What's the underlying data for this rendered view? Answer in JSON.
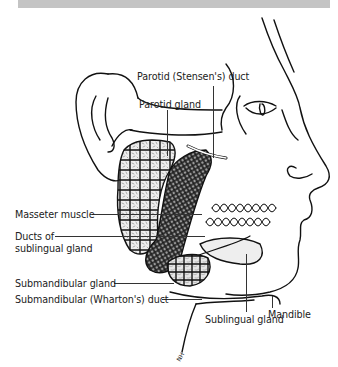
{
  "figure": {
    "header_bar_color": "#c4c4c4",
    "signature": "NH"
  },
  "labels": {
    "parotid_duct": "Parotid (Stensen's) duct",
    "parotid_gland": "Parotid gland",
    "masseter_muscle": "Masseter muscle",
    "ducts_sublingual_line1": "Ducts of",
    "ducts_sublingual_line2": "sublingual gland",
    "submandibular_gland": "Submandibular gland",
    "submandibular_duct": "Submandibular (Wharton's) duct",
    "mandible": "Mandible",
    "sublingual_gland": "Sublingual gland"
  }
}
